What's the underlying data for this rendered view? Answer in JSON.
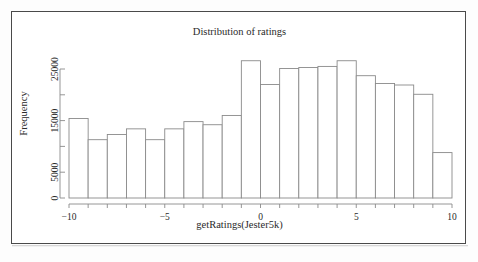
{
  "page": {
    "top_strip_text": "",
    "background_color": "#ffffff",
    "frame_color": "#4a4a4a",
    "bar_stroke_color": "#8a8a8a",
    "axis_color": "#8a8a8a",
    "text_color": "#2a2a2a"
  },
  "chart_data": {
    "type": "bar",
    "title": "Distribution of ratings",
    "xlabel": "getRatings(Jester5k)",
    "ylabel": "Frequency",
    "xlim": [
      -10,
      10
    ],
    "ylim": [
      0,
      27000
    ],
    "grid": false,
    "legend": null,
    "xticks": [
      -10,
      -5,
      0,
      5,
      10
    ],
    "xtick_labels": [
      "-10",
      "-5",
      "0",
      "5",
      "10"
    ],
    "yticks": [
      0,
      5000,
      15000,
      25000
    ],
    "ytick_labels": [
      "0",
      "5000",
      "15000",
      "25000"
    ],
    "minor_yticks": [
      10000,
      20000
    ],
    "bin_width": 1,
    "bin_edges": [
      -10,
      -9,
      -8,
      -7,
      -6,
      -5,
      -4,
      -3,
      -2,
      -1,
      0,
      1,
      2,
      3,
      4,
      5,
      6,
      7,
      8,
      9,
      10
    ],
    "categories": [
      "-10 to -9",
      "-9 to -8",
      "-8 to -7",
      "-7 to -6",
      "-6 to -5",
      "-5 to -4",
      "-4 to -3",
      "-3 to -2",
      "-2 to -1",
      "-1 to 0",
      "0 to 1",
      "1 to 2",
      "2 to 3",
      "3 to 4",
      "4 to 5",
      "5 to 6",
      "6 to 7",
      "7 to 8",
      "8 to 9",
      "9 to 10"
    ],
    "values": [
      15400,
      11300,
      12300,
      13400,
      11300,
      13400,
      14800,
      14200,
      16000,
      26600,
      22000,
      25100,
      25300,
      25500,
      26600,
      23700,
      22200,
      21900,
      20100,
      22100
    ],
    "bar_widths_units": [
      1,
      1,
      1,
      1,
      1,
      1,
      1,
      1,
      1,
      1,
      1,
      1,
      1,
      1,
      1,
      1,
      1,
      1,
      1,
      1
    ],
    "last_bar_note": "final bin near 9-10 is short (~8800)",
    "tail_bar_value": 8800
  }
}
